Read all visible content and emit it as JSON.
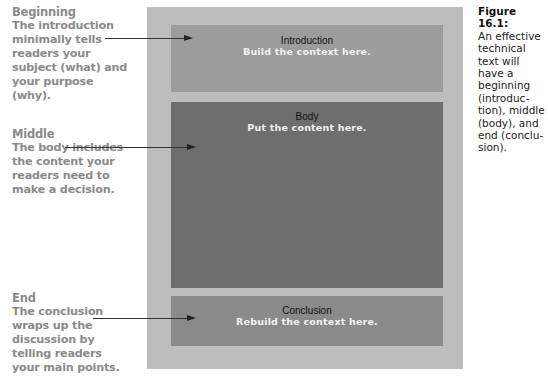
{
  "annotations": [
    {
      "heading": "Beginning",
      "text": "The introduction minimally tells readers your subject (what) and your purpose (why)."
    },
    {
      "heading": "Middle",
      "text": "The body includes the content your readers need to make a decision."
    },
    {
      "heading": "End",
      "text": "The conclusion wraps up the discussion by telling readers your main points."
    }
  ],
  "sections": [
    {
      "title": "Introduction",
      "subtitle": "Build the context here.",
      "color": "#9c9c9c"
    },
    {
      "title": "Body",
      "subtitle": "Put the content here.",
      "color": "#6e6e6e"
    },
    {
      "title": "Conclusion",
      "subtitle": "Rebuild the context here.",
      "color": "#8a8a8a"
    }
  ],
  "caption": {
    "figure_label": "Figure 16.1:",
    "text": "An effective technical text will have a beginning (introduc-tion), middle (body), and end (conclu-sion)."
  },
  "colors": {
    "outer_panel": "#bdbdbd",
    "annotation_text": "#8a8a8a"
  }
}
